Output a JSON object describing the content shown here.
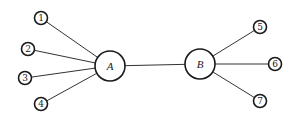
{
  "diagram": {
    "type": "star-network",
    "hubs": [
      {
        "id": "A",
        "label": "A",
        "x": 110,
        "y": 66,
        "r": 15
      },
      {
        "id": "B",
        "label": "B",
        "x": 200,
        "y": 64,
        "r": 15
      }
    ],
    "leaves": [
      {
        "id": "1",
        "label": "1",
        "x": 41,
        "y": 18,
        "r": 6.5,
        "hub": "A"
      },
      {
        "id": "2",
        "label": "2",
        "x": 28,
        "y": 49,
        "r": 6.5,
        "hub": "A"
      },
      {
        "id": "3",
        "label": "3",
        "x": 25,
        "y": 78,
        "r": 6.5,
        "hub": "A"
      },
      {
        "id": "4",
        "label": "4",
        "x": 41,
        "y": 104,
        "r": 6.5,
        "hub": "A"
      },
      {
        "id": "5",
        "label": "5",
        "x": 260,
        "y": 27,
        "r": 6.5,
        "hub": "B"
      },
      {
        "id": "6",
        "label": "6",
        "x": 275,
        "y": 64,
        "r": 6.5,
        "hub": "B"
      },
      {
        "id": "7",
        "label": "7",
        "x": 260,
        "y": 101,
        "r": 6.5,
        "hub": "B"
      }
    ],
    "edges": [
      [
        "1",
        "A"
      ],
      [
        "2",
        "A"
      ],
      [
        "3",
        "A"
      ],
      [
        "4",
        "A"
      ],
      [
        "A",
        "B"
      ],
      [
        "B",
        "5"
      ],
      [
        "B",
        "6"
      ],
      [
        "B",
        "7"
      ]
    ]
  }
}
